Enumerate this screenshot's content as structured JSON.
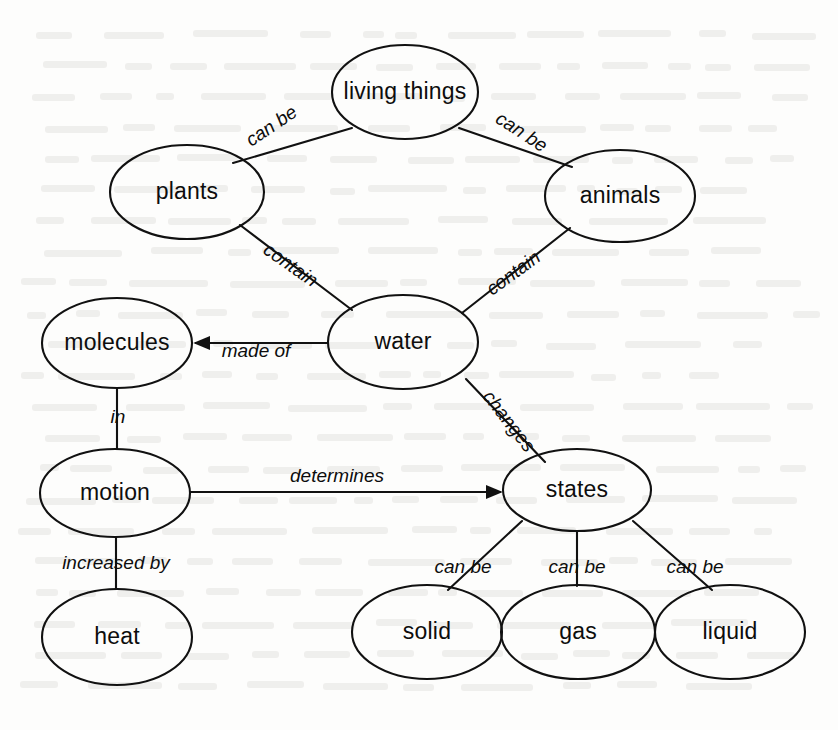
{
  "diagram": {
    "type": "concept-map",
    "width": 838,
    "height": 730,
    "background_color": "#fdfdfc",
    "stroke_color": "#111111",
    "text_color": "#0d0d0d",
    "nodes": [
      {
        "id": "living_things",
        "label": "living things",
        "cx": 405,
        "cy": 92,
        "rx": 73,
        "ry": 47
      },
      {
        "id": "plants",
        "label": "plants",
        "cx": 187,
        "cy": 192,
        "rx": 77,
        "ry": 47
      },
      {
        "id": "animals",
        "label": "animals",
        "cx": 620,
        "cy": 196,
        "rx": 75,
        "ry": 46
      },
      {
        "id": "water",
        "label": "water",
        "cx": 403,
        "cy": 342,
        "rx": 75,
        "ry": 47
      },
      {
        "id": "molecules",
        "label": "molecules",
        "cx": 117,
        "cy": 343,
        "rx": 75,
        "ry": 45
      },
      {
        "id": "motion",
        "label": "motion",
        "cx": 115,
        "cy": 493,
        "rx": 75,
        "ry": 44
      },
      {
        "id": "heat",
        "label": "heat",
        "cx": 117,
        "cy": 637,
        "rx": 75,
        "ry": 48
      },
      {
        "id": "states",
        "label": "states",
        "cx": 577,
        "cy": 490,
        "rx": 74,
        "ry": 41
      },
      {
        "id": "solid",
        "label": "solid",
        "cx": 427,
        "cy": 632,
        "rx": 75,
        "ry": 47
      },
      {
        "id": "gas",
        "label": "gas",
        "cx": 578,
        "cy": 632,
        "rx": 77,
        "ry": 47
      },
      {
        "id": "liquid",
        "label": "liquid",
        "cx": 730,
        "cy": 632,
        "rx": 75,
        "ry": 47
      }
    ],
    "edges": [
      {
        "id": "e1",
        "from": "living_things",
        "to": "plants",
        "label": "can be",
        "arrow": false,
        "label_x": 272,
        "label_y": 127,
        "label_rotate": -34
      },
      {
        "id": "e2",
        "from": "living_things",
        "to": "animals",
        "label": "can be",
        "arrow": false,
        "label_x": 521,
        "label_y": 133,
        "label_rotate": 33
      },
      {
        "id": "e3",
        "from": "plants",
        "to": "water",
        "label": "contain",
        "arrow": false,
        "label_x": 290,
        "label_y": 266,
        "label_rotate": 35
      },
      {
        "id": "e4",
        "from": "animals",
        "to": "water",
        "label": "contain",
        "arrow": false,
        "label_x": 514,
        "label_y": 274,
        "label_rotate": -36
      },
      {
        "id": "e5",
        "from": "water",
        "to": "molecules",
        "label": "made of",
        "arrow": true,
        "label_x": 256,
        "label_y": 352,
        "label_rotate": 0
      },
      {
        "id": "e6",
        "from": "molecules",
        "to": "motion",
        "label": "in",
        "arrow": false,
        "label_x": 118,
        "label_y": 418,
        "label_rotate": 0
      },
      {
        "id": "e7",
        "from": "motion",
        "to": "states",
        "label": "determines",
        "arrow": true,
        "label_x": 337,
        "label_y": 477,
        "label_rotate": 0
      },
      {
        "id": "e8",
        "from": "motion",
        "to": "heat",
        "label": "increased by",
        "arrow": false,
        "label_x": 116,
        "label_y": 564,
        "label_rotate": 0
      },
      {
        "id": "e9",
        "from": "water",
        "to": "states",
        "label": "changes",
        "arrow": false,
        "label_x": 508,
        "label_y": 422,
        "label_rotate": 52
      },
      {
        "id": "e10",
        "from": "states",
        "to": "solid",
        "label": "can be",
        "arrow": false,
        "label_x": 463,
        "label_y": 568,
        "label_rotate": 0
      },
      {
        "id": "e11",
        "from": "states",
        "to": "gas",
        "label": "can be",
        "arrow": false,
        "label_x": 577,
        "label_y": 568,
        "label_rotate": 0
      },
      {
        "id": "e12",
        "from": "states",
        "to": "liquid",
        "label": "can be",
        "arrow": false,
        "label_x": 695,
        "label_y": 568,
        "label_rotate": 0
      }
    ],
    "edge_paths": [
      {
        "id": "e1",
        "x1": 352,
        "y1": 128,
        "x2": 233,
        "y2": 163
      },
      {
        "id": "e2",
        "x1": 459,
        "y1": 128,
        "x2": 572,
        "y2": 167
      },
      {
        "id": "e3",
        "x1": 240,
        "y1": 225,
        "x2": 352,
        "y2": 310
      },
      {
        "id": "e4",
        "x1": 570,
        "y1": 228,
        "x2": 462,
        "y2": 313
      },
      {
        "id": "e5",
        "x1": 328,
        "y1": 343,
        "x2": 196,
        "y2": 343
      },
      {
        "id": "e6",
        "x1": 117,
        "y1": 388,
        "x2": 117,
        "y2": 449
      },
      {
        "id": "e7",
        "x1": 190,
        "y1": 492,
        "x2": 500,
        "y2": 492
      },
      {
        "id": "e8",
        "x1": 116,
        "y1": 537,
        "x2": 116,
        "y2": 589
      },
      {
        "id": "e9",
        "x1": 466,
        "y1": 379,
        "x2": 545,
        "y2": 462
      },
      {
        "id": "e10",
        "x1": 522,
        "y1": 521,
        "x2": 448,
        "y2": 590
      },
      {
        "id": "e11",
        "x1": 577,
        "y1": 531,
        "x2": 577,
        "y2": 586
      },
      {
        "id": "e12",
        "x1": 633,
        "y1": 521,
        "x2": 712,
        "y2": 590
      }
    ]
  }
}
